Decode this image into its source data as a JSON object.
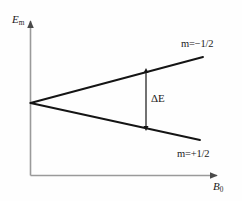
{
  "figure": {
    "background_color": "#fefefe",
    "axis_color": "#9a9a9a",
    "curve_color": "#141414"
  },
  "axes": {
    "y": {
      "label_text": "E",
      "label_sub": "m",
      "name": "energy"
    },
    "x": {
      "label_text": "B",
      "label_sub": "0",
      "name": "magnetic-flux-density"
    }
  },
  "annotations": {
    "upper_state": "m=−1/2",
    "lower_state": "m=+1/2",
    "splitting": "ΔE"
  },
  "chart_data": {
    "type": "line",
    "title": "",
    "xlabel": "B0",
    "ylabel": "Em",
    "xlim": [
      0,
      1
    ],
    "ylim": [
      -1,
      1
    ],
    "grid": false,
    "legend": "inline-end-labels",
    "series": [
      {
        "name": "m=−1/2",
        "label": "m=−1/2",
        "x": [
          0,
          1
        ],
        "values": [
          0,
          0.58
        ],
        "pixel_points": [
          [
            30,
            103
          ],
          [
            203,
            57
          ]
        ]
      },
      {
        "name": "m=+1/2",
        "label": "m=+1/2",
        "x": [
          0,
          1
        ],
        "values": [
          0,
          -0.47
        ],
        "pixel_points": [
          [
            30,
            103
          ],
          [
            200,
            140
          ]
        ]
      }
    ],
    "annotations": [
      {
        "type": "double-arrow",
        "label": "ΔE",
        "x": 0.67,
        "y_from": -0.25,
        "y_to": 0.36,
        "pixel_x": 146,
        "pixel_y_top": 70,
        "pixel_y_bottom": 128
      }
    ]
  }
}
